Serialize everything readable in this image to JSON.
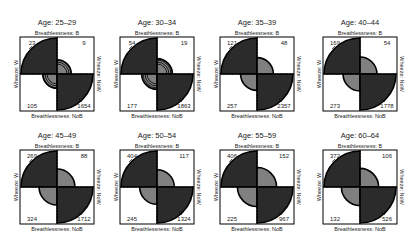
{
  "chart_data": {
    "type": "fourfold",
    "title": "",
    "layout": {
      "rows": 2,
      "cols": 4
    },
    "row_variable": "Wheeze",
    "col_variable": "Breathlessness",
    "labels": {
      "top": "Breathlessness: B",
      "bottom": "Breathlessness: NoB",
      "left": "Wheeze: W",
      "right": "Wheeze: NoW"
    },
    "cell_order": [
      "B/W (top-left)",
      "B/NoW (top-right)",
      "NoB/W (bottom-left)",
      "NoB/NoW (bottom-right)"
    ],
    "colors": {
      "positive_association": "#2b2b2b",
      "light_quadrant": "#ffffff",
      "center_disc": "#808080",
      "frame": "#000000"
    },
    "panels": [
      {
        "title": "Age: 25–29",
        "B_W": 23,
        "B_NoW": 9,
        "NoB_W": 105,
        "NoB_NoW": 1654,
        "confidence_rings": true
      },
      {
        "title": "Age: 30–34",
        "B_W": 54,
        "B_NoW": 19,
        "NoB_W": 177,
        "NoB_NoW": 1863,
        "confidence_rings": true
      },
      {
        "title": "Age: 35–39",
        "B_W": 121,
        "B_NoW": 48,
        "NoB_W": 257,
        "NoB_NoW": 2357,
        "confidence_rings": false
      },
      {
        "title": "Age: 40–44",
        "B_W": 169,
        "B_NoW": 54,
        "NoB_W": 273,
        "NoB_NoW": 1778,
        "confidence_rings": false
      },
      {
        "title": "Age: 45–49",
        "B_W": 269,
        "B_NoW": 88,
        "NoB_W": 324,
        "NoB_NoW": 1712,
        "confidence_rings": false
      },
      {
        "title": "Age: 50–54",
        "B_W": 404,
        "B_NoW": 117,
        "NoB_W": 245,
        "NoB_NoW": 1324,
        "confidence_rings": false
      },
      {
        "title": "Age: 55–59",
        "B_W": 406,
        "B_NoW": 152,
        "NoB_W": 225,
        "NoB_NoW": 967,
        "confidence_rings": false
      },
      {
        "title": "Age: 60–64",
        "B_W": 372,
        "B_NoW": 106,
        "NoB_W": 132,
        "NoB_NoW": 526,
        "confidence_rings": false
      }
    ]
  }
}
